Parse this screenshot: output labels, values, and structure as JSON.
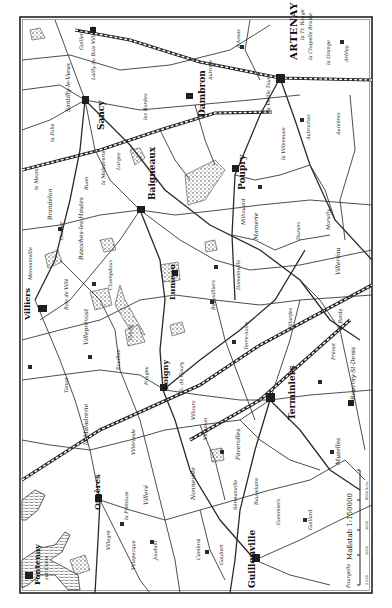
{
  "map": {
    "title": "Artenay – Orléans area (rotated)",
    "orientation_note": "labels read bottom-to-top",
    "colors": {
      "ink": "#1e1e1e",
      "paper": "#ffffff",
      "frame": "#222222"
    },
    "frame": {
      "x": 20,
      "y": 17,
      "w": 352,
      "h": 576
    },
    "scale": {
      "label": "Maßstab 1:150000",
      "ticks": [
        "5 000",
        "2000",
        "5000",
        "8000 Schr."
      ],
      "x": 358,
      "y": 505
    },
    "labels": [
      {
        "text": "ARTENAY",
        "x": 297,
        "y": 60,
        "size": 10,
        "cls": "lbl-city"
      },
      {
        "text": "la Tr. Rouge",
        "x": 304,
        "y": 40,
        "size": 5,
        "cls": "lbl"
      },
      {
        "text": "la Chapelle Brulée",
        "x": 312,
        "y": 60,
        "size": 5,
        "cls": "lbl"
      },
      {
        "text": "la Grange",
        "x": 330,
        "y": 65,
        "size": 5,
        "cls": "lbl"
      },
      {
        "text": "Arblay",
        "x": 348,
        "y": 62,
        "size": 5,
        "cls": "lbl"
      },
      {
        "text": "d'Assas",
        "x": 240,
        "y": 48,
        "size": 5,
        "cls": "lbl"
      },
      {
        "text": "Dambron",
        "x": 205,
        "y": 117,
        "size": 9,
        "cls": "lbl-town"
      },
      {
        "text": "Autroye",
        "x": 212,
        "y": 80,
        "size": 5,
        "cls": "lbl"
      },
      {
        "text": "Sancy",
        "x": 104,
        "y": 130,
        "size": 9,
        "cls": "lbl-town"
      },
      {
        "text": "Santilly-le-Vieux",
        "x": 70,
        "y": 112,
        "size": 6,
        "cls": "lbl"
      },
      {
        "text": "la Folie",
        "x": 54,
        "y": 142,
        "size": 5,
        "cls": "lbl"
      },
      {
        "text": "Lailly du Bois Villiers",
        "x": 95,
        "y": 80,
        "size": 5,
        "cls": "lbl"
      },
      {
        "text": "Gaillard",
        "x": 83,
        "y": 50,
        "size": 5,
        "cls": "lbl"
      },
      {
        "text": "la Vieille Tour",
        "x": 270,
        "y": 112,
        "size": 5,
        "cls": "lbl"
      },
      {
        "text": "la Villeneuve",
        "x": 285,
        "y": 160,
        "size": 5,
        "cls": "lbl"
      },
      {
        "text": "Autroches",
        "x": 310,
        "y": 140,
        "size": 5,
        "cls": "lbl"
      },
      {
        "text": "Aunières",
        "x": 340,
        "y": 135,
        "size": 5,
        "cls": "lbl"
      },
      {
        "text": "Poupry",
        "x": 245,
        "y": 190,
        "size": 9,
        "cls": "lbl-town"
      },
      {
        "text": "Baigneaux",
        "x": 155,
        "y": 200,
        "size": 9,
        "cls": "lbl-town"
      },
      {
        "text": "les Bordes",
        "x": 147,
        "y": 120,
        "size": 5,
        "cls": "lbl"
      },
      {
        "text": "la Maladrerie",
        "x": 105,
        "y": 185,
        "size": 5,
        "cls": "lbl"
      },
      {
        "text": "Ruan",
        "x": 88,
        "y": 190,
        "size": 5,
        "cls": "lbl"
      },
      {
        "text": "Lorges",
        "x": 120,
        "y": 170,
        "size": 5,
        "cls": "lbl"
      },
      {
        "text": "le Mesnil",
        "x": 38,
        "y": 190,
        "size": 5,
        "cls": "lbl"
      },
      {
        "text": "Brandelon",
        "x": 52,
        "y": 220,
        "size": 6,
        "cls": "lbl"
      },
      {
        "text": "Ouslier",
        "x": 63,
        "y": 240,
        "size": 5,
        "cls": "lbl"
      },
      {
        "text": "Bazoches-les-Hautes",
        "x": 83,
        "y": 260,
        "size": 6,
        "cls": "lbl"
      },
      {
        "text": "Champdoux",
        "x": 112,
        "y": 290,
        "size": 5,
        "cls": "lbl"
      },
      {
        "text": "Mennainville",
        "x": 32,
        "y": 280,
        "size": 5,
        "cls": "lbl"
      },
      {
        "text": "Villiers",
        "x": 30,
        "y": 320,
        "size": 8,
        "cls": "lbl-town"
      },
      {
        "text": "Bois de Villé",
        "x": 68,
        "y": 310,
        "size": 5,
        "cls": "lbl"
      },
      {
        "text": "Villeprévost",
        "x": 88,
        "y": 345,
        "size": 6,
        "cls": "lbl"
      },
      {
        "text": "Goury",
        "x": 132,
        "y": 340,
        "size": 5,
        "cls": "lbl"
      },
      {
        "text": "Ecuillon",
        "x": 120,
        "y": 370,
        "size": 5,
        "cls": "lbl"
      },
      {
        "text": "Tanon",
        "x": 68,
        "y": 393,
        "size": 5,
        "cls": "lbl"
      },
      {
        "text": "Lumeau",
        "x": 175,
        "y": 300,
        "size": 8,
        "cls": "lbl-town"
      },
      {
        "text": "Beauvilliers",
        "x": 215,
        "y": 310,
        "size": 5,
        "cls": "lbl"
      },
      {
        "text": "Domainville",
        "x": 240,
        "y": 290,
        "size": 5,
        "cls": "lbl"
      },
      {
        "text": "Milhouard",
        "x": 245,
        "y": 225,
        "size": 5,
        "cls": "lbl"
      },
      {
        "text": "Mamerie",
        "x": 258,
        "y": 240,
        "size": 6,
        "cls": "lbl"
      },
      {
        "text": "Duranx",
        "x": 300,
        "y": 240,
        "size": 5,
        "cls": "lbl"
      },
      {
        "text": "Morvilly",
        "x": 330,
        "y": 230,
        "size": 5,
        "cls": "lbl"
      },
      {
        "text": "Villeréau",
        "x": 340,
        "y": 275,
        "size": 6,
        "cls": "lbl"
      },
      {
        "text": "Loigny",
        "x": 168,
        "y": 390,
        "size": 8,
        "cls": "lbl-town"
      },
      {
        "text": "Ch. de Goury",
        "x": 183,
        "y": 395,
        "size": 5,
        "cls": "lbl"
      },
      {
        "text": "Fougeu",
        "x": 148,
        "y": 385,
        "size": 5,
        "cls": "lbl"
      },
      {
        "text": "Terre-noire",
        "x": 248,
        "y": 350,
        "size": 5,
        "cls": "lbl"
      },
      {
        "text": "Fillardes",
        "x": 292,
        "y": 330,
        "size": 5,
        "cls": "lbl"
      },
      {
        "text": "Terminiers",
        "x": 295,
        "y": 420,
        "size": 9,
        "cls": "lbl-town"
      },
      {
        "text": "Prénat",
        "x": 335,
        "y": 360,
        "size": 5,
        "cls": "lbl"
      },
      {
        "text": "Rouvray-St-Denis",
        "x": 355,
        "y": 400,
        "size": 6,
        "cls": "lbl"
      },
      {
        "text": "la Borde",
        "x": 342,
        "y": 330,
        "size": 5,
        "cls": "lbl"
      },
      {
        "text": "Faverolles",
        "x": 240,
        "y": 460,
        "size": 6,
        "cls": "lbl"
      },
      {
        "text": "Villours",
        "x": 195,
        "y": 420,
        "size": 5,
        "cls": "lbl"
      },
      {
        "text": "Villepion",
        "x": 207,
        "y": 440,
        "size": 5,
        "cls": "lbl"
      },
      {
        "text": "Muzelles",
        "x": 340,
        "y": 465,
        "size": 6,
        "cls": "lbl"
      },
      {
        "text": "la Maladrerie",
        "x": 88,
        "y": 445,
        "size": 6,
        "cls": "lbl"
      },
      {
        "text": "Villéronde",
        "x": 135,
        "y": 455,
        "size": 5,
        "cls": "lbl"
      },
      {
        "text": "Orgères",
        "x": 100,
        "y": 510,
        "size": 8,
        "cls": "lbl-town"
      },
      {
        "text": "la Fréteuse",
        "x": 128,
        "y": 520,
        "size": 5,
        "cls": "lbl"
      },
      {
        "text": "Villeré",
        "x": 148,
        "y": 505,
        "size": 6,
        "cls": "lbl"
      },
      {
        "text": "Villegré",
        "x": 110,
        "y": 550,
        "size": 5,
        "cls": "lbl"
      },
      {
        "text": "Villepecque",
        "x": 135,
        "y": 570,
        "size": 5,
        "cls": "lbl"
      },
      {
        "text": "Joudain",
        "x": 157,
        "y": 560,
        "size": 5,
        "cls": "lbl"
      },
      {
        "text": "Nonneville",
        "x": 195,
        "y": 500,
        "size": 6,
        "cls": "lbl"
      },
      {
        "text": "Guillonville",
        "x": 255,
        "y": 588,
        "size": 9,
        "cls": "lbl-town"
      },
      {
        "text": "Cambrai",
        "x": 200,
        "y": 560,
        "size": 5,
        "cls": "lbl"
      },
      {
        "text": "Gaubert",
        "x": 223,
        "y": 565,
        "size": 5,
        "cls": "lbl"
      },
      {
        "text": "Gommiers",
        "x": 280,
        "y": 525,
        "size": 5,
        "cls": "lbl"
      },
      {
        "text": "Bauvelaire",
        "x": 258,
        "y": 505,
        "size": 5,
        "cls": "lbl"
      },
      {
        "text": "Sérmanville",
        "x": 237,
        "y": 510,
        "size": 5,
        "cls": "lbl"
      },
      {
        "text": "Gaillard",
        "x": 312,
        "y": 530,
        "size": 5,
        "cls": "lbl"
      },
      {
        "text": "Fontenay",
        "x": 40,
        "y": 585,
        "size": 8,
        "cls": "lbl-town"
      },
      {
        "text": "sur Conie",
        "x": 48,
        "y": 580,
        "size": 5,
        "cls": "lbl"
      },
      {
        "text": "Pourgelle",
        "x": 350,
        "y": 588,
        "size": 5,
        "cls": "lbl"
      }
    ]
  }
}
